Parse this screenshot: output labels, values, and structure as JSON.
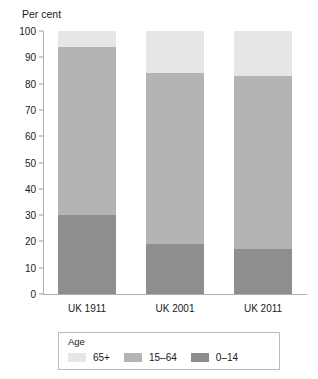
{
  "chart_data": {
    "type": "bar",
    "subtype": "stacked-percentage",
    "title": "",
    "ylabel": "Per cent",
    "xlabel": "",
    "categories": [
      "UK 1911",
      "UK 2001",
      "UK 2011"
    ],
    "ylim": [
      0,
      100
    ],
    "yticks": [
      0,
      10,
      20,
      30,
      40,
      50,
      60,
      70,
      80,
      90,
      100
    ],
    "ytick_labels": [
      "0",
      "10",
      "20",
      "30",
      "40",
      "50",
      "60",
      "70",
      "80",
      "90",
      "100"
    ],
    "grid": false,
    "legend_position": "bottom",
    "legend_title": "Age",
    "stack_order_bottom_to_top": [
      "0–14",
      "15–64",
      "65+"
    ],
    "series": [
      {
        "name": "65+",
        "color": "#e6e6e6",
        "values": [
          6,
          16,
          17
        ]
      },
      {
        "name": "15–64",
        "color": "#b4b4b4",
        "values": [
          64,
          65,
          66
        ]
      },
      {
        "name": "0–14",
        "color": "#8e8e8e",
        "values": [
          30,
          19,
          17
        ]
      }
    ]
  },
  "colors": {
    "age_65_plus": "#e6e6e6",
    "age_15_64": "#b4b4b4",
    "age_0_14": "#8e8e8e",
    "axis": "#b0b0b0",
    "text": "#1a1a1a",
    "legend_border": "#bcbcbc"
  }
}
